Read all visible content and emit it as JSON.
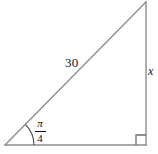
{
  "figure": {
    "stroke_color": "#8c8c8c",
    "text_color": "#111111",
    "background_color": "#ffffff",
    "labels": {
      "hypotenuse": "30",
      "opposite_side": "x",
      "angle_numerator": "π",
      "angle_denominator": "4",
      "angle_text": "π/4"
    },
    "marks": {
      "right_angle_marker": "right-angle-square",
      "angle_arc": "angle-arc"
    },
    "geometry": {
      "left_vertex": [
        5,
        145
      ],
      "right_vertex": [
        146,
        145
      ],
      "top_vertex": [
        146,
        2
      ],
      "base_length_px": 141,
      "height_px": 143
    }
  }
}
